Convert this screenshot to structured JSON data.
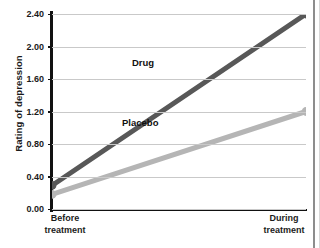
{
  "chart_data": {
    "type": "line",
    "title": "",
    "subtitle": "",
    "xlabel": "",
    "ylabel": "Rating of depression",
    "categories": [
      "Before treatment",
      "During treatment"
    ],
    "category_lines": [
      [
        "Before",
        "treatment"
      ],
      [
        "During",
        "treatment"
      ]
    ],
    "x": [
      0,
      1
    ],
    "series": [
      {
        "name": "Drug",
        "values": [
          0.29,
          2.4
        ],
        "color": "#585858"
      },
      {
        "name": "Placebo",
        "values": [
          0.18,
          1.2
        ],
        "color": "#b5b5b5"
      }
    ],
    "ylim": [
      0.0,
      2.4
    ],
    "yticks": [
      0.0,
      0.4,
      0.8,
      1.2,
      1.6,
      2.0,
      2.4
    ],
    "ytick_labels": [
      "0.00",
      "0.40",
      "0.80",
      "1.20",
      "1.60",
      "2.00",
      "2.40"
    ],
    "grid": "horizontal",
    "legend": "inline-labels",
    "annotations": [
      {
        "text": "Drug",
        "series": "Drug"
      },
      {
        "text": "Placebo",
        "series": "Placebo"
      }
    ],
    "markers": "filled-circle",
    "background": "#ffffff",
    "axis_color": "#111111",
    "grid_color": "#c9c9c9"
  }
}
